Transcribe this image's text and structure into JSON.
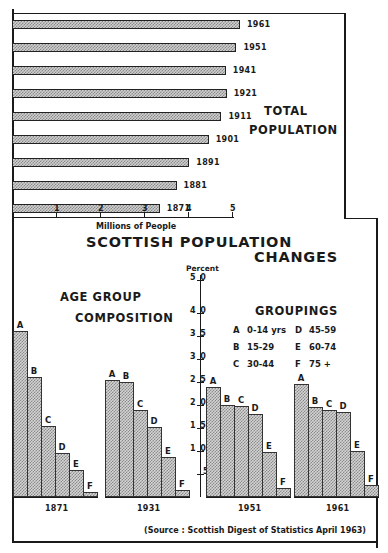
{
  "title": {
    "line1": "SCOTTISH POPULATION",
    "line2": "CHANGES"
  },
  "total_population": {
    "label_line1": "TOTAL",
    "label_line2": "POPULATION",
    "xlabel": "Millions of People",
    "ticks": [
      "1",
      "2",
      "3",
      "4",
      "5"
    ]
  },
  "age_group": {
    "label_line1": "AGE GROUP",
    "label_line2": "COMPOSITION",
    "ylabel": "Percent",
    "ticks": [
      "5",
      "10",
      "15",
      "20",
      "25",
      "30",
      "35",
      "40",
      "50"
    ],
    "tick_display": [
      "5",
      "1 0",
      "1 5",
      "2 0",
      "2 5",
      "3 0",
      "3 5",
      "4 0",
      "5 0"
    ],
    "bar_letters": [
      "A",
      "B",
      "C",
      "D",
      "E",
      "F"
    ],
    "years": [
      "1871",
      "1931",
      "1951",
      "1961"
    ]
  },
  "groupings": {
    "title": "GROUPINGS",
    "items": [
      {
        "key": "A",
        "range": "0-14 yrs"
      },
      {
        "key": "B",
        "range": "15-29"
      },
      {
        "key": "C",
        "range": "30-44"
      },
      {
        "key": "D",
        "range": "45-59"
      },
      {
        "key": "E",
        "range": "60-74"
      },
      {
        "key": "F",
        "range": "75 +"
      }
    ]
  },
  "source": "(Source : Scottish Digest of Statistics April 1963)",
  "colors": {
    "ink": "#1a1a1a",
    "bar_fill": "#cfcfcf",
    "bar_hatch": "#8a8a8a"
  },
  "chart_data": [
    {
      "type": "bar",
      "orientation": "horizontal",
      "title": "TOTAL POPULATION",
      "xlabel": "Millions of People",
      "ylabel": "",
      "categories": [
        "1961",
        "1951",
        "1941",
        "1921",
        "1911",
        "1901",
        "1891",
        "1881",
        "1871"
      ],
      "values": [
        5.18,
        5.1,
        4.86,
        4.88,
        4.76,
        4.47,
        4.03,
        3.74,
        3.36
      ],
      "xlim": [
        0,
        5
      ],
      "xticks": [
        1,
        2,
        3,
        4,
        5
      ],
      "grid": false,
      "legend": null
    },
    {
      "type": "bar",
      "title": "AGE GROUP COMPOSITION",
      "xlabel": "",
      "ylabel": "Percent",
      "categories": [
        "1871",
        "1931",
        "1951",
        "1961"
      ],
      "group_labels": [
        "A",
        "B",
        "C",
        "D",
        "E",
        "F"
      ],
      "series": [
        {
          "name": "A 0-14 yrs",
          "values": [
            36,
            25.5,
            24,
            24.6
          ]
        },
        {
          "name": "B 15-29",
          "values": [
            26,
            25,
            20,
            19.6
          ]
        },
        {
          "name": "C 30-44",
          "values": [
            15.5,
            19,
            19.8,
            19
          ]
        },
        {
          "name": "D 45-59",
          "values": [
            9.5,
            15.2,
            18,
            18.5
          ]
        },
        {
          "name": "E 60-74",
          "values": [
            5.9,
            8.7,
            9.8,
            10
          ]
        },
        {
          "name": "F 75 +",
          "values": [
            1.1,
            1.5,
            2,
            2.6
          ]
        }
      ],
      "yticks": [
        5,
        10,
        15,
        20,
        25,
        30,
        35,
        40,
        50
      ],
      "ylim": [
        0,
        50
      ],
      "grid": false,
      "legend": {
        "title": "GROUPINGS",
        "position": "upper right"
      }
    }
  ]
}
